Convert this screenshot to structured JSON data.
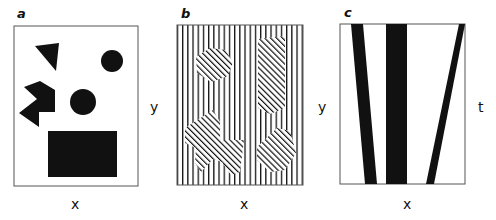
{
  "figure": {
    "panels": [
      {
        "id": "a",
        "letter": "a",
        "x_label": "x",
        "y_label": "y",
        "description": "Black shapes on white: triangle, two circles, notched polygon, rectangle"
      },
      {
        "id": "b",
        "letter": "b",
        "x_label": "x",
        "y_label": "y",
        "description": "Vertical line texture with diagonally hatched regions"
      },
      {
        "id": "c",
        "letter": "c",
        "x_label": "x",
        "y_label": "t",
        "description": "Three black bands: two slanted, one vertical"
      }
    ],
    "colors": {
      "ink": "#111111",
      "border": "#555555",
      "background": "#ffffff"
    }
  }
}
